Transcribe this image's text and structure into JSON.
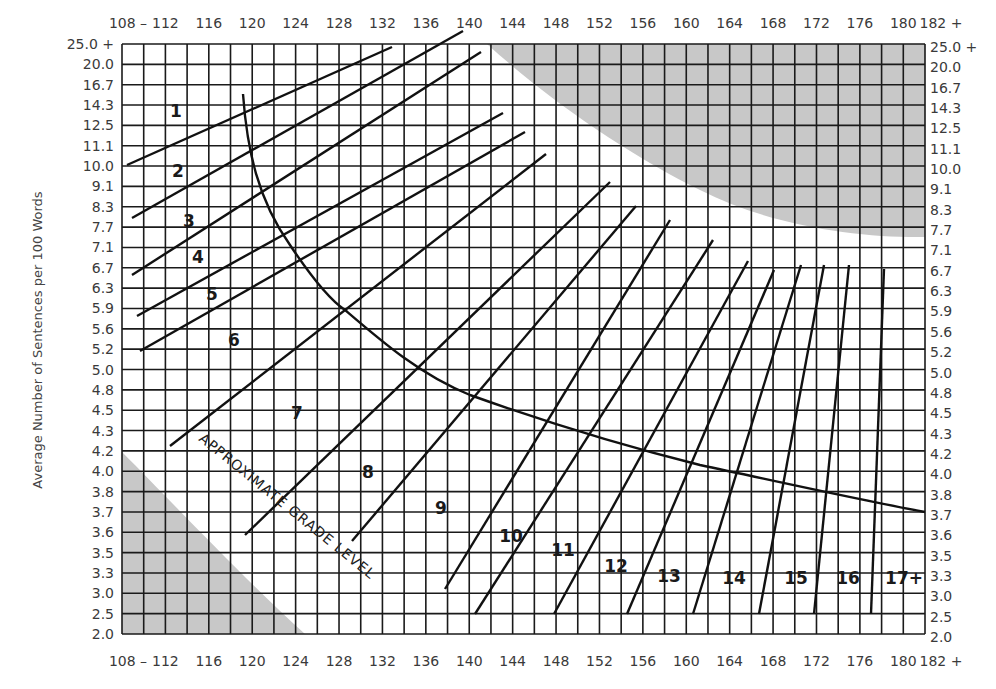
{
  "chart_data": {
    "type": "line",
    "xlabel": "Average Number of Syllables per 100 Words",
    "ylabel": "Average Number of Sentences per 100 Words",
    "x_ticks": [
      "108 –",
      "112",
      "116",
      "120",
      "124",
      "128",
      "132",
      "136",
      "140",
      "144",
      "148",
      "152",
      "156",
      "160",
      "164",
      "168",
      "172",
      "176",
      "180",
      "182 +"
    ],
    "x_range": [
      108,
      182
    ],
    "x_grid_step": 2,
    "y_ticks": [
      "25.0 +",
      "20.0",
      "16.7",
      "14.3",
      "12.5",
      "11.1",
      "10.0",
      "9.1",
      "8.3",
      "7.7",
      "7.1",
      "6.7",
      "6.3",
      "5.9",
      "5.6",
      "5.2",
      "5.0",
      "4.8",
      "4.5",
      "4.3",
      "4.2",
      "4.0",
      "3.8",
      "3.7",
      "3.6",
      "3.5",
      "3.3",
      "3.0",
      "2.5",
      "2.0"
    ],
    "grid": true,
    "annotation": "APPROXIMATE GRADE LEVEL",
    "shaded_regions": [
      "upper-right invalid zone",
      "lower-left invalid zone"
    ],
    "grade_labels": [
      "1",
      "2",
      "3",
      "4",
      "5",
      "6",
      "7",
      "8",
      "9",
      "10",
      "11",
      "12",
      "13",
      "14",
      "15",
      "16",
      "17+"
    ],
    "series": [
      {
        "name": "Grade 1/2 boundary",
        "from": [
          108,
          10.0
        ],
        "to": [
          133,
          25.0
        ]
      },
      {
        "name": "Grade 2/3 boundary",
        "from": [
          108,
          8.0
        ],
        "to": [
          141,
          20.0
        ]
      },
      {
        "name": "Grade 3/4 boundary",
        "from": [
          108,
          6.5
        ],
        "to": [
          141,
          17.0
        ]
      },
      {
        "name": "Grade 4/5 boundary",
        "from": [
          109,
          5.8
        ],
        "to": [
          144,
          13.5
        ]
      },
      {
        "name": "Grade 5/6 boundary",
        "from": [
          109,
          5.2
        ],
        "to": [
          146,
          11.8
        ]
      },
      {
        "name": "Grade 6/7 boundary",
        "from": [
          113,
          4.2
        ],
        "to": [
          148,
          10.6
        ]
      },
      {
        "name": "Grade 7/8 boundary",
        "from": [
          121,
          3.6
        ],
        "to": [
          154,
          9.3
        ]
      },
      {
        "name": "Grade 8/9 boundary",
        "from": [
          130,
          3.6
        ],
        "to": [
          156,
          8.6
        ]
      },
      {
        "name": "Grade 9/10 boundary",
        "from": [
          138,
          3.0
        ],
        "to": [
          158,
          8.0
        ]
      },
      {
        "name": "Grade 10/11 boundary",
        "from": [
          144,
          2.5
        ],
        "to": [
          162,
          7.3
        ]
      },
      {
        "name": "Grade 11/12 boundary",
        "from": [
          148,
          2.5
        ],
        "to": [
          165,
          7.1
        ]
      },
      {
        "name": "Grade 12/13 boundary",
        "from": [
          154,
          2.5
        ],
        "to": [
          168,
          6.9
        ]
      },
      {
        "name": "Grade 13/14 boundary",
        "from": [
          160,
          2.5
        ],
        "to": [
          170,
          6.7
        ]
      },
      {
        "name": "Grade 14/15 boundary",
        "from": [
          166,
          2.5
        ],
        "to": [
          172,
          6.7
        ]
      },
      {
        "name": "Grade 15/16 boundary",
        "from": [
          171,
          2.5
        ],
        "to": [
          174,
          6.7
        ]
      },
      {
        "name": "Grade 16/17+ boundary",
        "from": [
          176,
          2.5
        ],
        "to": [
          178,
          6.7
        ]
      },
      {
        "name": "Grade 17+ boundary",
        "from": [
          180,
          2.5
        ],
        "to": [
          181,
          6.7
        ]
      }
    ],
    "curve": {
      "name": "Approximate grade level curve",
      "points": [
        [
          120,
          16.0
        ],
        [
          122,
          9.1
        ],
        [
          126,
          6.3
        ],
        [
          130,
          5.6
        ],
        [
          136,
          5.0
        ],
        [
          144,
          4.5
        ],
        [
          152,
          4.2
        ],
        [
          160,
          4.0
        ],
        [
          170,
          3.8
        ],
        [
          182,
          3.7
        ]
      ]
    }
  },
  "labels": {
    "y_axis": "Average Number of Sentences per 100 Words",
    "annotation": "APPROXIMATE GRADE LEVEL",
    "grades": [
      "1",
      "2",
      "3",
      "4",
      "5",
      "6",
      "7",
      "8",
      "9",
      "10",
      "11",
      "12",
      "13",
      "14",
      "15",
      "16",
      "17+"
    ]
  },
  "colors": {
    "grid": "#1a1a1a",
    "shade": "#c8c8c8",
    "line": "#111111",
    "text": "#3a3a3a"
  }
}
